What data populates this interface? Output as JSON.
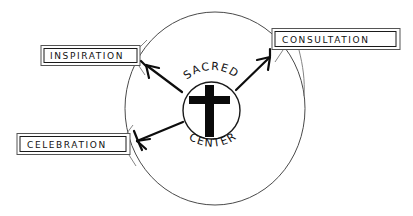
{
  "diagram": {
    "title_center": {
      "arc_top": "SACRED",
      "arc_bottom": "CENTER",
      "symbol": "christian-cross"
    },
    "nodes": [
      {
        "id": "inspiration",
        "label": "INSPIRATION"
      },
      {
        "id": "consultation",
        "label": "CONSULTATION"
      },
      {
        "id": "celebration",
        "label": "CELEBRATION"
      }
    ],
    "colors": {
      "background": "#ffffff",
      "ink": "#111111",
      "ring": "#4a4a4a",
      "box_border": "#1a1a1a"
    }
  }
}
